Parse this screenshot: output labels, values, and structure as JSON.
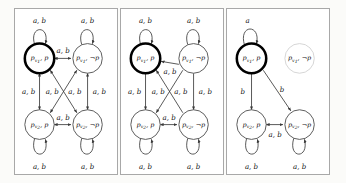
{
  "figure": {
    "type": "diagram",
    "panel_count": 3,
    "alphabet": [
      "a",
      "b"
    ],
    "edge_label_full": "a, b",
    "edge_label_a": "a",
    "edge_label_b": "b"
  },
  "state_labels": {
    "v1_p": {
      "base": "p",
      "sub": "v",
      "subsub": "1",
      "prop": "p"
    },
    "v1_np": {
      "base": "p",
      "sub": "v",
      "subsub": "1",
      "prop": "¬p"
    },
    "v2_p": {
      "base": "p",
      "sub": "v",
      "subsub": "2",
      "prop": "p"
    },
    "v2_np": {
      "base": "p",
      "sub": "v",
      "subsub": "2",
      "prop": "¬p"
    }
  },
  "panels": [
    {
      "id": "panel-1",
      "name": "full-structure",
      "states": [
        {
          "key": "v1_p",
          "position": "top-left",
          "emphasis": "bold",
          "visible": true
        },
        {
          "key": "v1_np",
          "position": "top-right",
          "emphasis": "normal",
          "visible": true
        },
        {
          "key": "v2_p",
          "position": "bottom-left",
          "emphasis": "normal",
          "visible": true
        },
        {
          "key": "v2_np",
          "position": "bottom-right",
          "emphasis": "normal",
          "visible": true
        }
      ],
      "self_loops": [
        {
          "at": "top-left",
          "label": "a, b"
        },
        {
          "at": "top-right",
          "label": "a, b"
        },
        {
          "at": "bottom-left",
          "label": "a, b"
        },
        {
          "at": "bottom-right",
          "label": "a, b"
        }
      ],
      "edges": [
        {
          "from": "top-left",
          "to": "top-right",
          "label": "a, b",
          "direction": "both"
        },
        {
          "from": "bottom-left",
          "to": "bottom-right",
          "label": "a, b",
          "direction": "both"
        },
        {
          "from": "top-left",
          "to": "bottom-left",
          "label": "a, b",
          "direction": "both"
        },
        {
          "from": "top-right",
          "to": "bottom-right",
          "label": "a, b",
          "direction": "both"
        },
        {
          "from": "top-left",
          "to": "bottom-right",
          "label": "a, b",
          "direction": "both"
        },
        {
          "from": "top-right",
          "to": "bottom-left",
          "label": "a, b",
          "direction": "both"
        }
      ]
    },
    {
      "id": "panel-2",
      "name": "partially-pruned",
      "states": [
        {
          "key": "v1_p",
          "position": "top-left",
          "emphasis": "bold",
          "visible": true
        },
        {
          "key": "v1_np",
          "position": "top-right",
          "emphasis": "normal",
          "visible": true
        },
        {
          "key": "v2_p",
          "position": "bottom-left",
          "emphasis": "normal",
          "visible": true
        },
        {
          "key": "v2_np",
          "position": "bottom-right",
          "emphasis": "normal",
          "visible": true
        }
      ],
      "self_loops": [
        {
          "at": "top-left",
          "label": "a, b"
        },
        {
          "at": "top-right",
          "label": "a, b"
        },
        {
          "at": "bottom-left",
          "label": "a, b"
        },
        {
          "at": "bottom-right",
          "label": "a, b"
        }
      ],
      "edges": [
        {
          "from": "top-right",
          "to": "top-left",
          "label": "a, b",
          "direction": "one"
        },
        {
          "from": "bottom-left",
          "to": "bottom-right",
          "label": "a, b",
          "direction": "both"
        },
        {
          "from": "top-left",
          "to": "bottom-left",
          "label": "a, b",
          "direction": "both"
        },
        {
          "from": "top-right",
          "to": "bottom-right",
          "label": "a, b",
          "direction": "one"
        },
        {
          "from": "top-right",
          "to": "bottom-left",
          "label": "a, b",
          "direction": "one"
        },
        {
          "from": "bottom-right",
          "to": "top-left",
          "label": "a, b",
          "direction": "one"
        }
      ]
    },
    {
      "id": "panel-3",
      "name": "reduced-structure",
      "states": [
        {
          "key": "v1_p",
          "position": "top-left",
          "emphasis": "bold",
          "visible": true
        },
        {
          "key": "v1_np",
          "position": "top-right",
          "emphasis": "faded",
          "visible": true
        },
        {
          "key": "v2_p",
          "position": "bottom-left",
          "emphasis": "normal",
          "visible": true
        },
        {
          "key": "v2_np",
          "position": "bottom-right",
          "emphasis": "normal",
          "visible": true
        }
      ],
      "self_loops": [
        {
          "at": "top-left",
          "label": "a"
        },
        {
          "at": "bottom-left",
          "label": "a, b"
        },
        {
          "at": "bottom-right",
          "label": "a, b"
        }
      ],
      "edges": [
        {
          "from": "top-left",
          "to": "bottom-left",
          "label": "b",
          "direction": "one"
        },
        {
          "from": "top-left",
          "to": "bottom-right",
          "label": "b",
          "direction": "one"
        },
        {
          "from": "bottom-left",
          "to": "bottom-right",
          "label": "a, b",
          "direction": "both"
        }
      ]
    }
  ]
}
